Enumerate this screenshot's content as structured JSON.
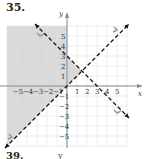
{
  "problem": {
    "number": "35.",
    "next_number": "39.",
    "next_fragment": "y"
  },
  "chart_data": {
    "type": "line",
    "title": "",
    "xlabel": "x",
    "ylabel": "y",
    "xlim": [
      -6,
      6
    ],
    "ylim": [
      -6,
      6
    ],
    "grid": true,
    "x_ticks": [
      -5,
      -4,
      -3,
      -2,
      -1,
      1,
      2,
      3,
      4,
      5
    ],
    "y_ticks": [
      5,
      4,
      3,
      2,
      1,
      -1,
      -2,
      -3,
      -4,
      -5
    ],
    "series": [
      {
        "name": "y = x",
        "style": "dashed",
        "color": "#111111",
        "points": [
          [
            -6.2,
            -6.2
          ],
          [
            6.2,
            6.2
          ]
        ]
      },
      {
        "name": "y = -x + 3",
        "style": "dashed",
        "color": "#111111",
        "points": [
          [
            -3.2,
            6.2
          ],
          [
            6.2,
            -3.2
          ]
        ]
      }
    ],
    "shaded_region": {
      "color": "#d9d9d9",
      "polygon": [
        [
          -6,
          6
        ],
        [
          0,
          6
        ],
        [
          0,
          3
        ],
        [
          1.5,
          1.5
        ],
        [
          -6,
          -6
        ]
      ]
    },
    "intersection": [
      1.5,
      1.5
    ]
  },
  "colors": {
    "grid": "#e3e3e3",
    "axis": "#888888",
    "shade": "#d9d9d9",
    "line": "#111111",
    "marker": "#999999"
  }
}
